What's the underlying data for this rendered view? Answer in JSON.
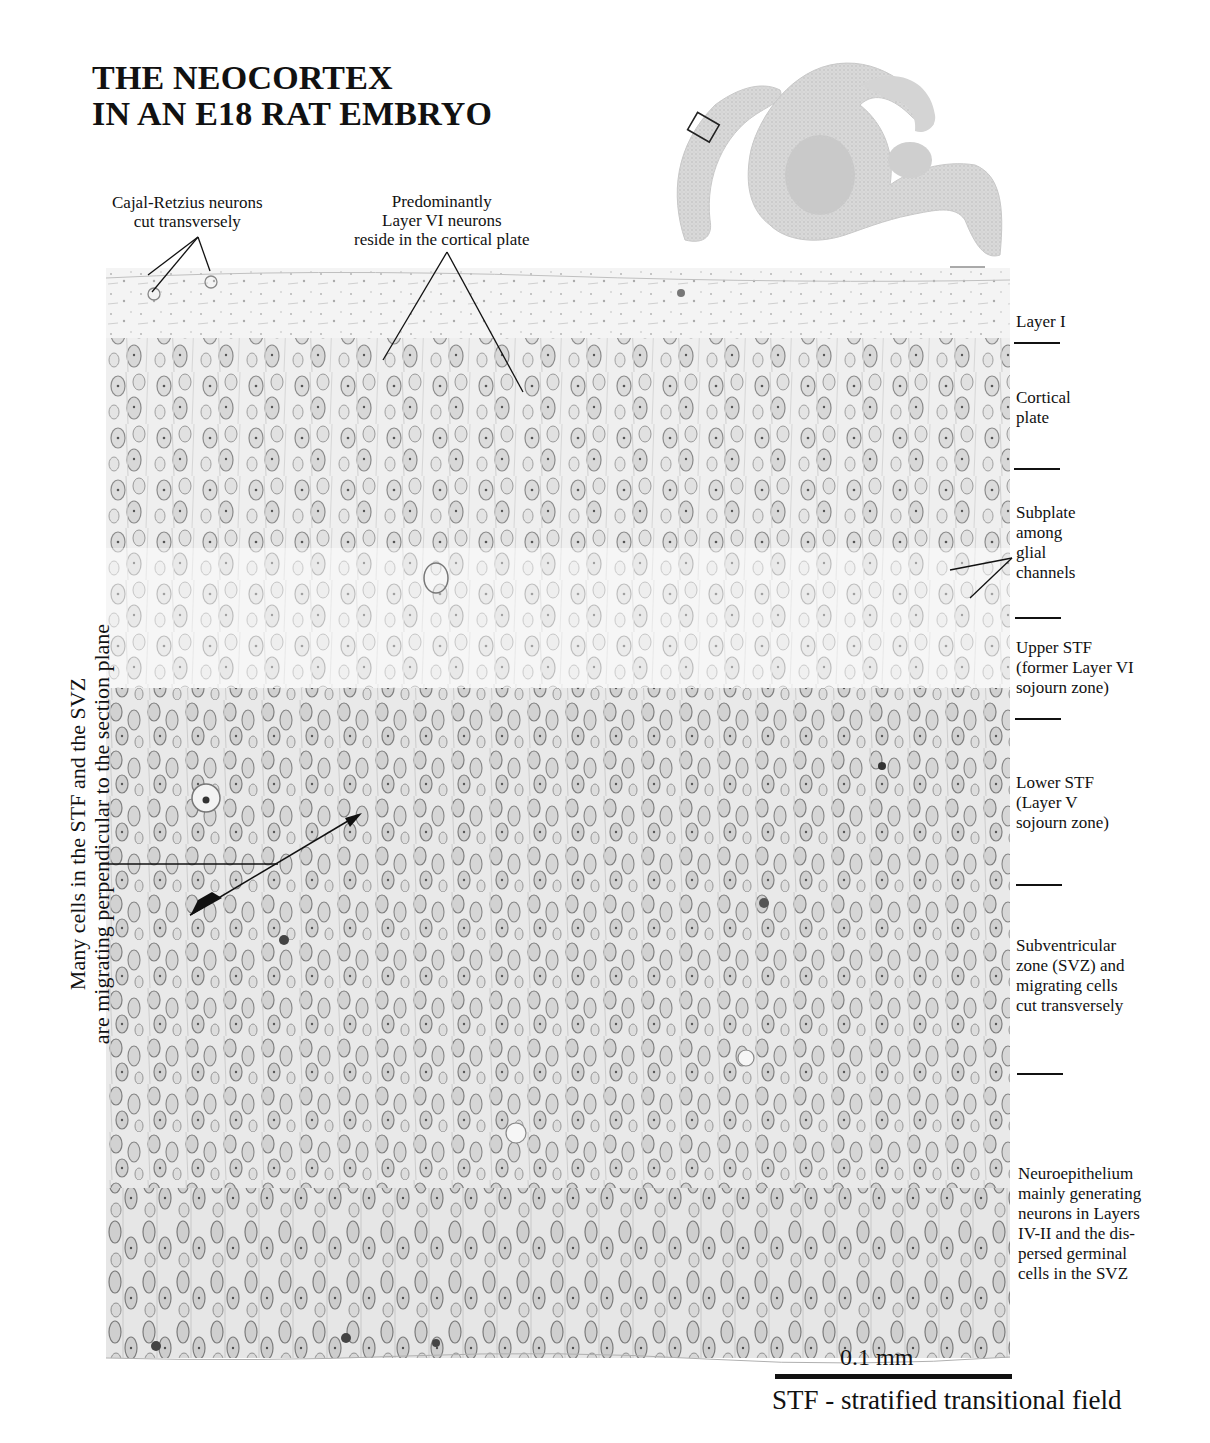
{
  "title": {
    "line1": "THE NEOCORTEX",
    "line2": "IN AN E18 RAT EMBRYO"
  },
  "inset": {
    "description": "Sagittal brain section overview with box marking the magnified neocortex region",
    "icon": "brain-section-overview"
  },
  "callouts": {
    "cajal_retzius": {
      "line1": "Cajal-Retzius neurons",
      "line2": "cut transversely"
    },
    "layer_vi": {
      "line1": "Predominantly",
      "line2": "Layer VI neurons",
      "line3": "reside in the cortical plate"
    }
  },
  "layers": [
    {
      "id": "layer-i",
      "lines": [
        "Layer I"
      ]
    },
    {
      "id": "cortical-plate",
      "lines": [
        "Cortical",
        "plate"
      ]
    },
    {
      "id": "subplate",
      "lines": [
        "Subplate",
        "among",
        "glial",
        "channels"
      ]
    },
    {
      "id": "upper-stf",
      "lines": [
        "Upper STF",
        "(former Layer VI",
        "sojourn zone)"
      ]
    },
    {
      "id": "lower-stf",
      "lines": [
        "Lower STF",
        "(Layer V",
        "sojourn zone)"
      ]
    },
    {
      "id": "svz",
      "lines": [
        "Subventricular",
        "zone (SVZ) and",
        "migrating cells",
        "cut transversely"
      ]
    },
    {
      "id": "neuroepithelium",
      "lines": [
        "Neuroepithelium",
        "mainly generating",
        "neurons in Layers",
        "IV-II and the dis-",
        "persed germinal",
        "cells in the SVZ"
      ]
    }
  ],
  "side_note": {
    "line1": "Many cells in the STF and the SVZ",
    "line2": "are migrating perpendicular to the section plane"
  },
  "scale": {
    "label": "0.1 mm"
  },
  "footnote": "STF - stratified transitional field",
  "colors": {
    "ink": "#111111",
    "tissue": "#9a9a9a",
    "background": "#ffffff"
  }
}
